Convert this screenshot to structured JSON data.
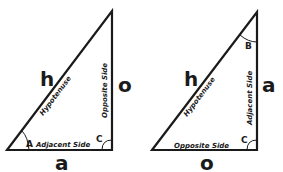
{
  "diagram": {
    "left_triangle": {
      "angles": {
        "reference": "A",
        "right": "C"
      },
      "side_labels": {
        "hypotenuse": "Hypotenuse",
        "opposite": "Opposite Side",
        "adjacent": "Adjacent Side"
      },
      "letters": {
        "hypotenuse": "h",
        "opposite": "o",
        "adjacent": "a"
      }
    },
    "right_triangle": {
      "angles": {
        "reference": "B",
        "right": "C"
      },
      "side_labels": {
        "hypotenuse": "Hypotenuse",
        "opposite": "Opposite Side",
        "adjacent": "Adjacent Side"
      },
      "letters": {
        "hypotenuse": "h",
        "opposite": "o",
        "adjacent": "a"
      }
    }
  }
}
